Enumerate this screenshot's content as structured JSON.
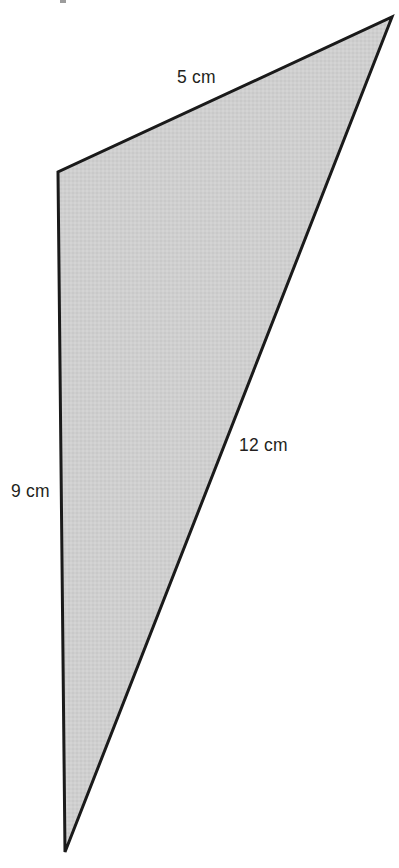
{
  "figure": {
    "background_color": "#ffffff",
    "fill_color": "#cdcdcd",
    "stroke_color": "#1a1a1a",
    "stroke_width": 3,
    "text_color": "#231f20",
    "vertices": {
      "apex_top_right": {
        "x": 392,
        "y": 17
      },
      "upper_left": {
        "x": 58,
        "y": 172
      },
      "bottom": {
        "x": 65,
        "y": 852
      }
    },
    "labels": {
      "top_edge": "5 cm",
      "right_edge": "12 cm",
      "left_edge": "9 cm"
    }
  },
  "chart_data": {
    "type": "diagram",
    "shape": "triangle",
    "title": "",
    "sides": [
      {
        "name": "top",
        "label": "5 cm",
        "value": 5,
        "unit": "cm",
        "from": "upper_left",
        "to": "apex_top_right"
      },
      {
        "name": "right",
        "label": "12 cm",
        "value": 12,
        "unit": "cm",
        "from": "apex_top_right",
        "to": "bottom"
      },
      {
        "name": "left",
        "label": "9 cm",
        "value": 9,
        "unit": "cm",
        "from": "bottom",
        "to": "upper_left"
      }
    ]
  }
}
